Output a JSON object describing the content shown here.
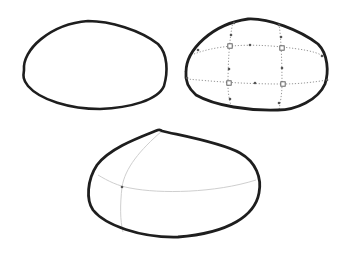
{
  "canvas": {
    "width": 347,
    "height": 254,
    "background": "#ffffff"
  },
  "colors": {
    "outline": "#1e1e1e",
    "grid": "#8a8a8a",
    "guide": "#cfcfcf",
    "point": "#555555"
  },
  "shapes": [
    {
      "id": "plain-blob",
      "outline_path": "M 24 70 C 22 50, 50 24, 88 21 C 110 21, 140 30, 158 44 C 168 54, 168 72, 164 86 C 158 100, 130 108, 100 109 C 70 109, 40 100, 28 86 C 23 80, 23 76, 24 70 Z",
      "stroke_width": 2.6
    },
    {
      "id": "mesh-blob",
      "outline_path": "M 186 72 C 186 50, 212 24, 248 19 C 268 18, 300 30, 318 44 C 328 54, 329 72, 325 84 C 318 100, 296 110, 278 110 C 250 111, 215 106, 196 95 C 188 88, 185 80, 186 72 Z",
      "stroke_width": 2.8,
      "grid_lines": [
        "M 194 54 C 215 46, 245 43, 282 47 C 300 49, 315 51, 323 56",
        "M 187 79 C 210 81, 240 84, 282 84 C 300 84, 315 82, 327 80",
        "M 233 22 C 229 40, 228 65, 228 85 C 228 95, 230 103, 232 108",
        "M 279 24 C 281 38, 282 60, 282 84 C 282 95, 280 103, 279 110"
      ],
      "square_points": [
        [
          230,
          46
        ],
        [
          282,
          48
        ],
        [
          229,
          83
        ],
        [
          283,
          84
        ]
      ],
      "dot_points": [
        [
          231,
          35
        ],
        [
          250,
          45
        ],
        [
          229,
          69
        ],
        [
          255,
          83
        ],
        [
          281,
          37
        ],
        [
          282,
          68
        ],
        [
          230,
          99
        ],
        [
          279,
          103
        ],
        [
          234,
          23
        ],
        [
          279,
          25
        ],
        [
          198,
          50
        ],
        [
          322,
          56
        ],
        [
          187,
          78
        ],
        [
          327,
          80
        ]
      ]
    },
    {
      "id": "dome-blob",
      "outline_path": "M 162 131 C 178 135, 220 142, 240 153 C 256 162, 262 178, 259 193 C 255 215, 230 233, 178 237 C 140 238, 105 225, 93 210 C 86 200, 87 180, 97 165 C 110 148, 138 138, 158 130 C 160 129.5, 161 130, 162 131 Z",
      "stroke_width": 2.8,
      "guide_lines": [
        "M 98 175 C 108 181, 118 186, 130 188 C 160 194, 215 193, 256 180",
        "M 162 131 C 140 150, 125 168, 122 187 C 120 205, 120 220, 123 232"
      ],
      "dot_points": [
        [
          122,
          187
        ]
      ]
    }
  ]
}
